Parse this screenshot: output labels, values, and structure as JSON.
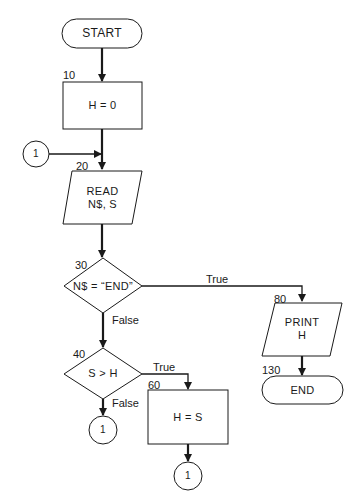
{
  "diagram": {
    "type": "flowchart",
    "nodes": [
      {
        "id": "start",
        "shape": "terminal",
        "text": "START"
      },
      {
        "id": "n10",
        "shape": "process",
        "line_no": "10",
        "text": "H = 0"
      },
      {
        "id": "c1_in",
        "shape": "connector",
        "text": "1"
      },
      {
        "id": "n20",
        "shape": "io",
        "line_no": "20",
        "line1": "READ",
        "line2": "N$, S"
      },
      {
        "id": "n30",
        "shape": "decision",
        "line_no": "30",
        "text": "N$ = “END”"
      },
      {
        "id": "n80",
        "shape": "io",
        "line_no": "80",
        "line1": "PRINT",
        "line2": "H"
      },
      {
        "id": "n130",
        "shape": "terminal",
        "line_no": "130",
        "text": "END"
      },
      {
        "id": "n40",
        "shape": "decision",
        "line_no": "40",
        "text": "S > H"
      },
      {
        "id": "n60",
        "shape": "process",
        "line_no": "60",
        "text": "H = S"
      },
      {
        "id": "c1_false",
        "shape": "connector",
        "text": "1"
      },
      {
        "id": "c1_after60",
        "shape": "connector",
        "text": "1"
      }
    ],
    "edges": [
      {
        "from": "start",
        "to": "n10",
        "label": ""
      },
      {
        "from": "n10",
        "to": "n20",
        "label": ""
      },
      {
        "from": "c1_in",
        "to": "n20",
        "label": ""
      },
      {
        "from": "n20",
        "to": "n30",
        "label": ""
      },
      {
        "from": "n30",
        "to": "n80",
        "label": "True"
      },
      {
        "from": "n30",
        "to": "n40",
        "label": "False"
      },
      {
        "from": "n80",
        "to": "n130",
        "label": ""
      },
      {
        "from": "n40",
        "to": "n60",
        "label": "True"
      },
      {
        "from": "n40",
        "to": "c1_false",
        "label": "False"
      },
      {
        "from": "n60",
        "to": "c1_after60",
        "label": ""
      }
    ],
    "edge_labels": {
      "true": "True",
      "false": "False"
    }
  }
}
